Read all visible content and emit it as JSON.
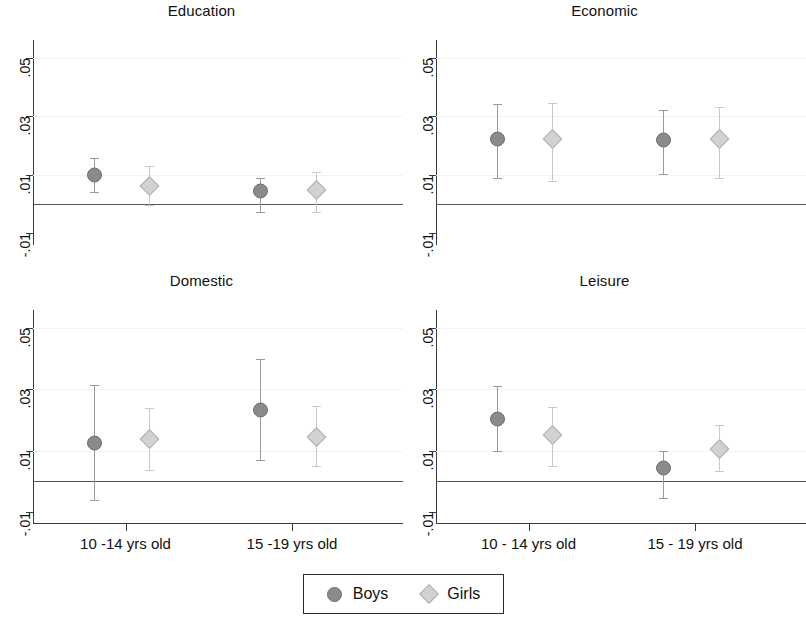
{
  "chart_data": {
    "type": "scatter",
    "title": "",
    "subtitle": "",
    "xlabel": "",
    "ylabel": "",
    "ylim": [
      -0.014,
      0.056
    ],
    "yticks": [
      0.05,
      0.03,
      0.01,
      -0.01
    ],
    "ytick_labels": [
      ".05",
      ".03",
      ".01",
      "-.01"
    ],
    "grid": false,
    "zero_reference_line": 0,
    "legend_position": "bottom-center",
    "categories": [
      "10 -14 yrs old",
      "15 -19 yrs old"
    ],
    "series": [
      {
        "name": "Boys",
        "marker": "circle",
        "color": "#8a8a8a"
      },
      {
        "name": "Girls",
        "marker": "diamond",
        "color": "#d2d2d2"
      }
    ],
    "panels": [
      {
        "title": "Education",
        "points": [
          {
            "group": "10 -14 yrs old",
            "series": "Boys",
            "value": 0.01,
            "ci_low": 0.004,
            "ci_high": 0.0158
          },
          {
            "group": "10 -14 yrs old",
            "series": "Girls",
            "value": 0.0063,
            "ci_low": -0.0005,
            "ci_high": 0.013
          },
          {
            "group": "15 -19 yrs old",
            "series": "Boys",
            "value": 0.0044,
            "ci_low": -0.0026,
            "ci_high": 0.0088
          },
          {
            "group": "15 -19 yrs old",
            "series": "Girls",
            "value": 0.0048,
            "ci_low": -0.0026,
            "ci_high": 0.011
          }
        ]
      },
      {
        "title": "Economic",
        "points": [
          {
            "group": "10 -14 yrs old",
            "series": "Boys",
            "value": 0.0222,
            "ci_low": 0.0088,
            "ci_high": 0.034
          },
          {
            "group": "10 -14 yrs old",
            "series": "Girls",
            "value": 0.0222,
            "ci_low": 0.0077,
            "ci_high": 0.0345
          },
          {
            "group": "15 -19 yrs old",
            "series": "Boys",
            "value": 0.022,
            "ci_low": 0.0103,
            "ci_high": 0.032
          },
          {
            "group": "15 -19 yrs old",
            "series": "Girls",
            "value": 0.0222,
            "ci_low": 0.0088,
            "ci_high": 0.033
          }
        ]
      },
      {
        "title": "Domestic",
        "points": [
          {
            "group": "10 -14 yrs old",
            "series": "Boys",
            "value": 0.0125,
            "ci_low": -0.0062,
            "ci_high": 0.0315
          },
          {
            "group": "10 -14 yrs old",
            "series": "Girls",
            "value": 0.0138,
            "ci_low": 0.0036,
            "ci_high": 0.024
          },
          {
            "group": "15 -19 yrs old",
            "series": "Boys",
            "value": 0.0232,
            "ci_low": 0.0068,
            "ci_high": 0.04
          },
          {
            "group": "15 -19 yrs old",
            "series": "Girls",
            "value": 0.0145,
            "ci_low": 0.005,
            "ci_high": 0.0245
          }
        ]
      },
      {
        "title": "Leisure",
        "points": [
          {
            "group": "10 - 14 yrs old",
            "series": "Boys",
            "value": 0.0202,
            "ci_low": 0.0098,
            "ci_high": 0.0312
          },
          {
            "group": "10 - 14 yrs old",
            "series": "Girls",
            "value": 0.015,
            "ci_low": 0.005,
            "ci_high": 0.0243
          },
          {
            "group": "15 - 19 yrs old",
            "series": "Boys",
            "value": 0.0044,
            "ci_low": -0.0054,
            "ci_high": 0.01
          },
          {
            "group": "15 - 19 yrs old",
            "series": "Girls",
            "value": 0.0105,
            "ci_low": 0.0032,
            "ci_high": 0.0185
          }
        ]
      }
    ]
  },
  "panels": {
    "education": {
      "title": "Education"
    },
    "economic": {
      "title": "Economic"
    },
    "domestic": {
      "title": "Domestic"
    },
    "leisure": {
      "title": "Leisure"
    }
  },
  "axis": {
    "yticks": [
      ".05",
      ".03",
      ".01",
      "-.01"
    ]
  },
  "xaxis": {
    "left": {
      "g1": "10 -14 yrs old",
      "g2": "15 -19 yrs old"
    },
    "right": {
      "g1": "10 - 14 yrs old",
      "g2": "15 - 19 yrs old"
    }
  },
  "legend": {
    "boys": "Boys",
    "girls": "Girls"
  }
}
